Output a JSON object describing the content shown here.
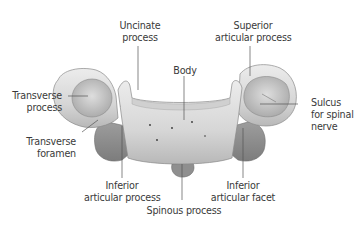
{
  "figure": {
    "colors": {
      "background": "#ffffff",
      "bone_light": "#e4e4e4",
      "bone_mid": "#c9c9c9",
      "bone_dark": "#9a9a9a",
      "leader_line": "#555555",
      "label_text": "#3a3a3a"
    },
    "labels": {
      "uncinate_process": [
        "Uncinate",
        "process"
      ],
      "superior_articular_process": [
        "Superior",
        "articular process"
      ],
      "body": [
        "Body"
      ],
      "transverse_process": [
        "Transverse",
        "process"
      ],
      "sulcus_spinal_nerve": [
        "Sulcus",
        "for spinal",
        "nerve"
      ],
      "transverse_foramen": [
        "Transverse",
        "foramen"
      ],
      "inferior_articular_process": [
        "Inferior",
        "articular process"
      ],
      "inferior_articular_facet": [
        "Inferior",
        "articular facet"
      ],
      "spinous_process": [
        "Spinous process"
      ]
    }
  }
}
